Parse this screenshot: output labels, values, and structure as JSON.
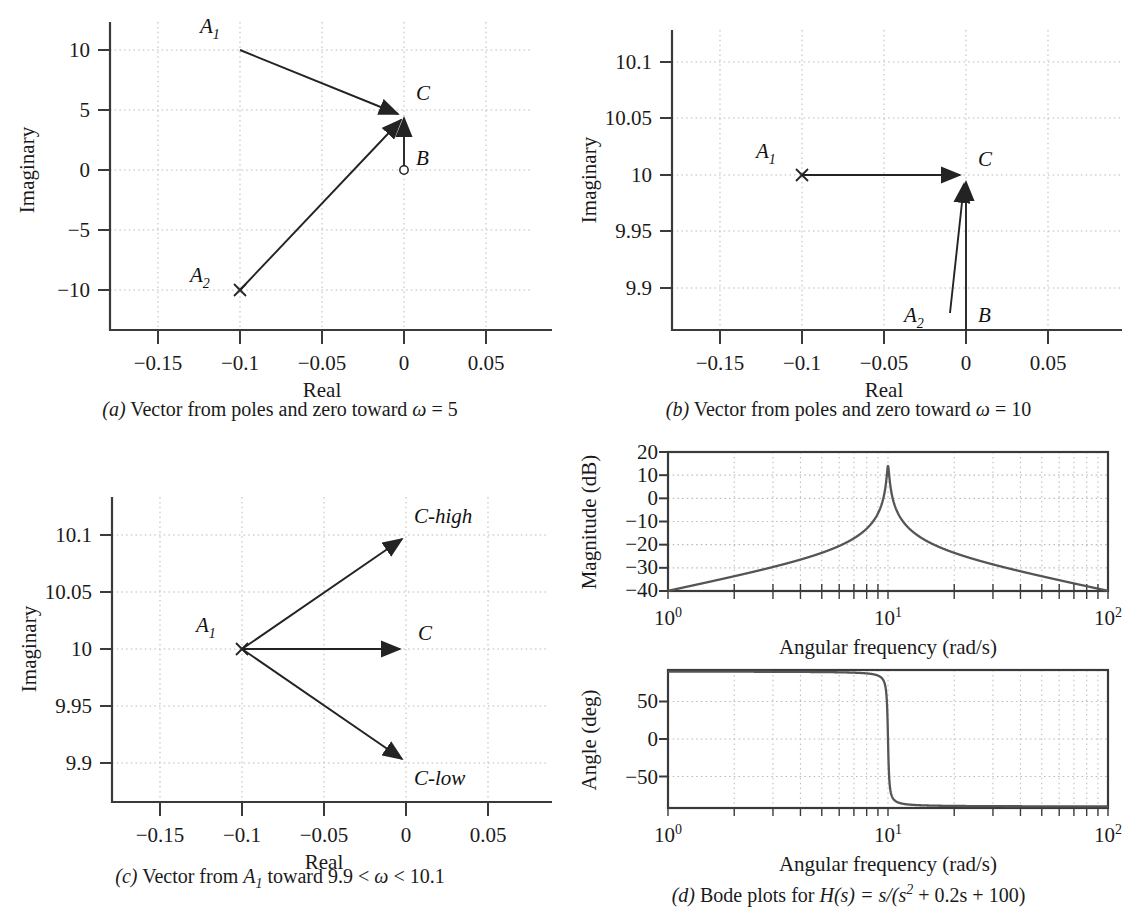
{
  "panels": {
    "a": {
      "caption_letter": "(a)",
      "caption_text": "Vector from poles and zero toward ",
      "caption_omega": "ω",
      "caption_tail": " = 5",
      "xlabel": "Real",
      "ylabel": "Imaginary",
      "xticks": [
        "−0.15",
        "−0.1",
        "−0.05",
        "0",
        "0.05"
      ],
      "xtickvals": [
        -0.15,
        -0.1,
        -0.05,
        0,
        0.05
      ],
      "yticks": [
        "10",
        "5",
        "0",
        "−5",
        "−10"
      ],
      "ytickvals": [
        10,
        5,
        0,
        -5,
        -10
      ],
      "xlim": [
        -0.175,
        0.072
      ],
      "ylim": [
        -12.6,
        12.0
      ],
      "markers": [
        {
          "label": "A",
          "sub": "1",
          "x": -0.1,
          "y": 10,
          "type": "pole-x",
          "label_dx": -26,
          "label_dy": -12
        },
        {
          "label": "A",
          "sub": "2",
          "x": -0.1,
          "y": -10,
          "type": "pole-x",
          "label_dx": -34,
          "label_dy": -10
        },
        {
          "label": "B",
          "sub": "",
          "x": 0.0,
          "y": 0,
          "type": "zero-o",
          "label_dx": 12,
          "label_dy": -6
        },
        {
          "label": "C",
          "sub": "",
          "x": 0.0,
          "y": 5,
          "type": "target",
          "label_dx": 12,
          "label_dy": -10
        }
      ],
      "vectors": [
        {
          "name": "A1-to-C",
          "from": [
            -0.1,
            10
          ],
          "to": [
            0.0,
            5
          ]
        },
        {
          "name": "A2-to-C",
          "from": [
            -0.1,
            -10
          ],
          "to": [
            0.0,
            5
          ]
        },
        {
          "name": "B-to-C",
          "from": [
            0.0,
            0
          ],
          "to": [
            0.0,
            5
          ]
        }
      ]
    },
    "b": {
      "caption_letter": "(b)",
      "caption_text": "Vector from poles and zero toward ",
      "caption_omega": "ω",
      "caption_tail": " = 10",
      "xlabel": "Real",
      "ylabel": "Imaginary",
      "xticks": [
        "−0.15",
        "−0.1",
        "−0.05",
        "0",
        "0.05"
      ],
      "xtickvals": [
        -0.15,
        -0.1,
        -0.05,
        0,
        0.05
      ],
      "yticks": [
        "10.1",
        "10.05",
        "10",
        "9.95",
        "9.9"
      ],
      "ytickvals": [
        10.1,
        10.05,
        10,
        9.95,
        9.9
      ],
      "xlim": [
        -0.175,
        0.072
      ],
      "ylim": [
        9.874,
        10.122
      ],
      "markers": [
        {
          "label": "A",
          "sub": "1",
          "x": -0.1,
          "y": 10,
          "type": "pole-x",
          "label_dx": -30,
          "label_dy": -14
        },
        {
          "label": "A",
          "sub": "2",
          "x": -0.012,
          "y": 9.884,
          "type": "leader",
          "label_dx": -34,
          "label_dy": 4
        },
        {
          "label": "B",
          "sub": "",
          "x": 0.004,
          "y": 9.884,
          "type": "text",
          "label_dx": 8,
          "label_dy": 4
        },
        {
          "label": "C",
          "sub": "",
          "x": 0.0,
          "y": 10,
          "type": "target",
          "label_dx": 12,
          "label_dy": -12
        }
      ],
      "vectors": [
        {
          "name": "A1-to-C",
          "from": [
            -0.1,
            10
          ],
          "to": [
            0.0,
            10
          ]
        },
        {
          "name": "A2-to-C",
          "from": [
            -0.0165,
            9.889
          ],
          "to": [
            0.0,
            9.995
          ]
        },
        {
          "name": "B-to-C",
          "from": [
            0.0,
            9.874
          ],
          "to": [
            0.0,
            10
          ]
        }
      ]
    },
    "c": {
      "caption_letter": "(c)",
      "caption_text": "Vector from ",
      "caption_a": "A",
      "caption_a_sub": "1",
      "caption_tail": " toward 9.9 < ",
      "caption_omega": "ω",
      "caption_tail2": " < 10.1",
      "xlabel": "Real",
      "ylabel": "Imaginary",
      "xticks": [
        "−0.15",
        "−0.1",
        "−0.05",
        "0",
        "0.05"
      ],
      "xtickvals": [
        -0.15,
        -0.1,
        -0.05,
        0,
        0.05
      ],
      "yticks": [
        "10.1",
        "10.05",
        "10",
        "9.95",
        "9.9"
      ],
      "ytickvals": [
        10.1,
        10.05,
        10,
        9.95,
        9.9
      ],
      "xlim": [
        -0.175,
        0.072
      ],
      "ylim": [
        9.874,
        10.122
      ],
      "markers": [
        {
          "label": "A",
          "sub": "1",
          "x": -0.1,
          "y": 10,
          "type": "pole-x",
          "label_dx": -34,
          "label_dy": -12
        },
        {
          "label": "C-high",
          "sub": "",
          "x": 0.0,
          "y": 10.1,
          "type": "target",
          "label_dx": 10,
          "label_dy": -14
        },
        {
          "label": "C",
          "sub": "",
          "x": 0.0,
          "y": 10,
          "type": "target",
          "label_dx": 12,
          "label_dy": -12
        },
        {
          "label": "C-low",
          "sub": "",
          "x": 0.0,
          "y": 9.9,
          "type": "target",
          "label_dx": 10,
          "label_dy": 24
        }
      ],
      "vectors": [
        {
          "name": "A1-to-Chigh",
          "from": [
            -0.1,
            10
          ],
          "to": [
            0.0,
            10.1
          ]
        },
        {
          "name": "A1-to-C",
          "from": [
            -0.1,
            10
          ],
          "to": [
            0.0,
            10
          ]
        },
        {
          "name": "A1-to-Clow",
          "from": [
            -0.1,
            10
          ],
          "to": [
            0.0,
            9.9
          ]
        }
      ]
    },
    "d": {
      "caption_letter": "(d)",
      "caption_text": "Bode plots for ",
      "caption_h": "H",
      "caption_formula_1": "(s) = s/(s",
      "caption_formula_sup": "2",
      "caption_formula_2": " + 0.2s + 100)",
      "magnitude": {
        "ylabel": "Magnitude (dB)",
        "xlabel": "Angular frequency (rad/s)",
        "yticks": [
          "20",
          "10",
          "0",
          "−10",
          "−20",
          "−30",
          "−40"
        ],
        "ytickvals": [
          20,
          10,
          0,
          -10,
          -20,
          -30,
          -40
        ],
        "xticks": [
          "10",
          "10",
          "10"
        ],
        "xtickexp": [
          "0",
          "1",
          "2"
        ],
        "xtickvals": [
          1,
          10,
          100
        ],
        "ylim": [
          -40,
          20
        ],
        "xlim": [
          1,
          100
        ]
      },
      "phase": {
        "ylabel": "Angle (deg)",
        "xlabel": "Angular frequency (rad/s)",
        "yticks": [
          "50",
          "0",
          "−50"
        ],
        "ytickvals": [
          50,
          0,
          -50
        ],
        "xticks": [
          "10",
          "10",
          "10"
        ],
        "xtickexp": [
          "0",
          "1",
          "2"
        ],
        "xtickvals": [
          1,
          10,
          100
        ],
        "ylim": [
          -92,
          92
        ],
        "xlim": [
          1,
          100
        ]
      }
    }
  },
  "chart_data": [
    {
      "type": "scatter",
      "id": "panel-a-pole-zero",
      "title": "(a) Vector from poles and zero toward ω = 5",
      "xlabel": "Real",
      "ylabel": "Imaginary",
      "xlim": [
        -0.175,
        0.072
      ],
      "ylim": [
        -12.6,
        12.0
      ],
      "grid": true,
      "points": [
        {
          "name": "A1",
          "marker": "x",
          "x": -0.1,
          "y": 10
        },
        {
          "name": "A2",
          "marker": "x",
          "x": -0.1,
          "y": -10
        },
        {
          "name": "B",
          "marker": "o",
          "x": 0.0,
          "y": 0
        },
        {
          "name": "C",
          "marker": "arrowtip",
          "x": 0.0,
          "y": 5
        }
      ],
      "arrows": [
        {
          "from": [
            -0.1,
            10
          ],
          "to": [
            0.0,
            5
          ]
        },
        {
          "from": [
            -0.1,
            -10
          ],
          "to": [
            0.0,
            5
          ]
        },
        {
          "from": [
            0.0,
            0
          ],
          "to": [
            0.0,
            5
          ]
        }
      ]
    },
    {
      "type": "scatter",
      "id": "panel-b-pole-zero",
      "title": "(b) Vector from poles and zero toward ω = 10",
      "xlabel": "Real",
      "ylabel": "Imaginary",
      "xlim": [
        -0.175,
        0.072
      ],
      "ylim": [
        9.874,
        10.122
      ],
      "grid": true,
      "points": [
        {
          "name": "A1",
          "marker": "x",
          "x": -0.1,
          "y": 10
        },
        {
          "name": "C",
          "marker": "arrowtip",
          "x": 0.0,
          "y": 10
        }
      ],
      "arrows": [
        {
          "from": [
            -0.1,
            10
          ],
          "to": [
            0.0,
            10
          ]
        },
        {
          "from": [
            -0.0165,
            9.889
          ],
          "to": [
            0.0,
            9.995
          ]
        },
        {
          "from": [
            0.0,
            9.874
          ],
          "to": [
            0.0,
            10
          ]
        }
      ]
    },
    {
      "type": "scatter",
      "id": "panel-c-pole-zero",
      "title": "(c) Vector from A1 toward 9.9 < ω < 10.1",
      "xlabel": "Real",
      "ylabel": "Imaginary",
      "xlim": [
        -0.175,
        0.072
      ],
      "ylim": [
        9.874,
        10.122
      ],
      "grid": true,
      "points": [
        {
          "name": "A1",
          "marker": "x",
          "x": -0.1,
          "y": 10
        },
        {
          "name": "C-high",
          "marker": "arrowtip",
          "x": 0.0,
          "y": 10.1
        },
        {
          "name": "C",
          "marker": "arrowtip",
          "x": 0.0,
          "y": 10
        },
        {
          "name": "C-low",
          "marker": "arrowtip",
          "x": 0.0,
          "y": 9.9
        }
      ],
      "arrows": [
        {
          "from": [
            -0.1,
            10
          ],
          "to": [
            0.0,
            10.1
          ]
        },
        {
          "from": [
            -0.1,
            10
          ],
          "to": [
            0.0,
            10
          ]
        },
        {
          "from": [
            -0.1,
            10
          ],
          "to": [
            0.0,
            9.9
          ]
        }
      ]
    },
    {
      "type": "line",
      "id": "panel-d-magnitude",
      "title": "(d) Bode magnitude for H(s) = s/(s^2 + 0.2s + 100)",
      "xlabel": "Angular frequency (rad/s)",
      "ylabel": "Magnitude (dB)",
      "xscale": "log",
      "xlim": [
        1,
        100
      ],
      "ylim": [
        -40,
        20
      ],
      "grid": true,
      "transfer_function": {
        "num": "s",
        "den": "s^2 + 0.2s + 100",
        "wn": 10,
        "zeta": 0.01
      },
      "key_values": [
        {
          "w": 1,
          "mag_db": -40
        },
        {
          "w": 2,
          "mag_db": -33.9
        },
        {
          "w": 5,
          "mag_db": -23.5
        },
        {
          "w": 8,
          "mag_db": -17.1
        },
        {
          "w": 10,
          "mag_db": 13.98
        },
        {
          "w": 12.5,
          "mag_db": -16.1
        },
        {
          "w": 20,
          "mag_db": -23.5
        },
        {
          "w": 50,
          "mag_db": -33.9
        },
        {
          "w": 100,
          "mag_db": -40
        }
      ]
    },
    {
      "type": "line",
      "id": "panel-d-phase",
      "title": "(d) Bode phase for H(s) = s/(s^2 + 0.2s + 100)",
      "xlabel": "Angular frequency (rad/s)",
      "ylabel": "Angle (deg)",
      "xscale": "log",
      "xlim": [
        1,
        100
      ],
      "ylim": [
        -92,
        92
      ],
      "grid": true,
      "key_values": [
        {
          "w": 1,
          "phase_deg": 90
        },
        {
          "w": 5,
          "phase_deg": 89.9
        },
        {
          "w": 9.5,
          "phase_deg": 85
        },
        {
          "w": 10,
          "phase_deg": 0
        },
        {
          "w": 10.5,
          "phase_deg": -85
        },
        {
          "w": 20,
          "phase_deg": -89.9
        },
        {
          "w": 100,
          "phase_deg": -90
        }
      ]
    }
  ]
}
